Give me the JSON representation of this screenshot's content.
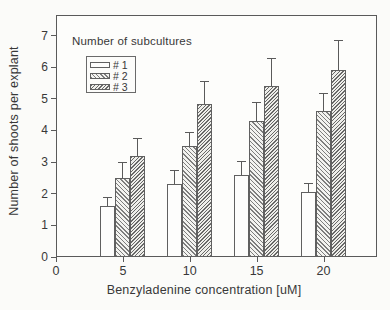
{
  "style": {
    "background": "#fbfbf9",
    "axis_color": "#5a5a5a",
    "text_color": "#383838",
    "bar_border_color": "#606060",
    "bar_plain_fill": "#fdfdfc",
    "hatch_color": "#6e6e6e"
  },
  "chart_data": {
    "type": "bar",
    "title": "",
    "legend_title": "Number of subcultures",
    "xlabel": "Benzyladenine concentration [uM]",
    "ylabel": "Number of shoots per explant",
    "x_ticks": [
      0,
      5,
      10,
      15,
      20
    ],
    "y_ticks": [
      0,
      1,
      2,
      3,
      4,
      5,
      6,
      7
    ],
    "xlim": [
      0,
      24
    ],
    "ylim": [
      0,
      7.65
    ],
    "grid": false,
    "legend_position": "top-left-inside",
    "error_bars": "upper",
    "categories": [
      5,
      10,
      15,
      20
    ],
    "series": [
      {
        "name": "# 1",
        "pattern": "plain",
        "values": [
          1.6,
          2.3,
          2.6,
          2.05
        ],
        "errors": [
          0.3,
          0.45,
          0.45,
          0.3
        ]
      },
      {
        "name": "# 2",
        "pattern": "hatch-forward",
        "values": [
          2.5,
          3.5,
          4.3,
          4.6
        ],
        "errors": [
          0.5,
          0.45,
          0.6,
          0.6
        ]
      },
      {
        "name": "# 3",
        "pattern": "hatch-back",
        "values": [
          3.2,
          4.85,
          5.4,
          5.9
        ],
        "errors": [
          0.55,
          0.7,
          0.9,
          0.95
        ]
      }
    ]
  }
}
